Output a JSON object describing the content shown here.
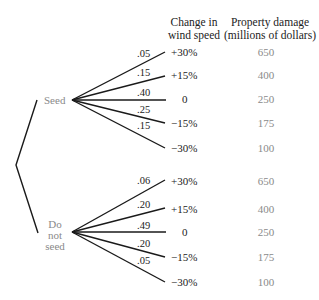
{
  "headers": {
    "wind_speed": [
      "Change in",
      "wind speed"
    ],
    "damage": [
      "Property damage",
      "(millions of dollars)"
    ]
  },
  "decisions": [
    {
      "label": [
        "Seed"
      ],
      "branches": [
        {
          "probability": ".05",
          "change": "+30%",
          "damage": "650"
        },
        {
          "probability": ".15",
          "change": "+15%",
          "damage": "400"
        },
        {
          "probability": ".40",
          "change": "0",
          "damage": "250"
        },
        {
          "probability": ".25",
          "change": "−15%",
          "damage": "175"
        },
        {
          "probability": ".15",
          "change": "−30%",
          "damage": "100"
        }
      ]
    },
    {
      "label": [
        "Do",
        "not",
        "seed"
      ],
      "branches": [
        {
          "probability": ".06",
          "change": "+30%",
          "damage": "650"
        },
        {
          "probability": ".20",
          "change": "+15%",
          "damage": "400"
        },
        {
          "probability": ".49",
          "change": "0",
          "damage": "250"
        },
        {
          "probability": ".20",
          "change": "−15%",
          "damage": "175"
        },
        {
          "probability": ".05",
          "change": "−30%",
          "damage": "100"
        }
      ]
    }
  ],
  "colors": {
    "line": "#1a1a1a",
    "text": "#222222",
    "muted_text": "#8a8a8a"
  }
}
